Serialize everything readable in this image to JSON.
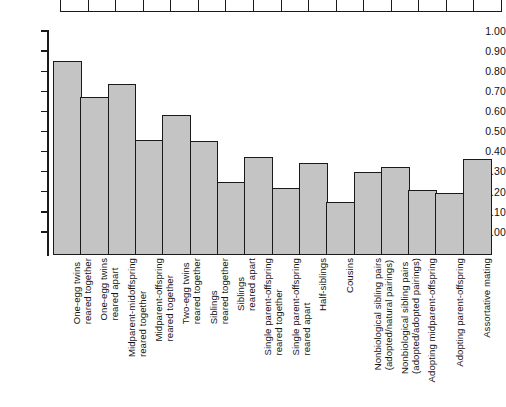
{
  "chart_data": {
    "type": "bar",
    "title": "",
    "xlabel": "",
    "ylabel": "",
    "ylim": [
      0.0,
      1.0
    ],
    "ytick_labels": [
      "1.00",
      "0.90",
      "0.80",
      "0.70",
      "0.60",
      "0.50",
      "0.40",
      "0.30",
      "0.20",
      "0.10",
      "0.00"
    ],
    "ytick_values": [
      1.0,
      0.9,
      0.8,
      0.7,
      0.6,
      0.5,
      0.4,
      0.3,
      0.2,
      0.1,
      0.0
    ],
    "grid": false,
    "legend": "none",
    "bar_fill_color": "#c4c4c4",
    "bar_edge_color": "#1a1a1a",
    "categories": [
      "One-egg twins reared together",
      "One-egg twins reared apart",
      "Midparent-midoffspring reared together",
      "Midparent-offspring reared together",
      "Two-egg twins reared together",
      "Siblings reared together",
      "Siblings reared apart",
      "Single parent-offspring reared together",
      "Single parent-offspring reared apart",
      "Half-siblings",
      "Cousins",
      "Nonbiological sibling pairs (adopted/natural pairings)",
      "Nonbiological sibling pairs (adopted/adopted pairings)",
      "Adopting midparent-offspring",
      "Adopting parent-offspring",
      "Assortative mating"
    ],
    "category_lines": [
      [
        "One-egg twins",
        "reared together"
      ],
      [
        "One-egg twins",
        "reared apart"
      ],
      [
        "Midparent-midoffspring",
        "reared together"
      ],
      [
        "Midparent-offspring",
        "reared together"
      ],
      [
        "Two-egg twins",
        "reared together"
      ],
      [
        "Siblings",
        "reared together"
      ],
      [
        "Siblings",
        "reared apart"
      ],
      [
        "Single parent-offspring",
        "reared together"
      ],
      [
        "Single parent-offspring",
        "reared apart"
      ],
      [
        "Half-siblings",
        ""
      ],
      [
        "Cousins",
        ""
      ],
      [
        "Nonbiological sibling pairs",
        "(adopted/natural pairings)"
      ],
      [
        "Nonbiological sibling pairs",
        "(adopted/adopted pairings)"
      ],
      [
        "Adopting midparent-offspring",
        ""
      ],
      [
        "Adopting parent-offspring",
        ""
      ],
      [
        "Assortative mating",
        ""
      ]
    ],
    "values": [
      0.85,
      0.67,
      0.735,
      0.46,
      0.58,
      0.455,
      0.25,
      0.375,
      0.22,
      0.345,
      0.15,
      0.3,
      0.325,
      0.21,
      0.195,
      0.365
    ]
  },
  "top_table": {
    "visible_cell_count": 16,
    "note": ""
  }
}
